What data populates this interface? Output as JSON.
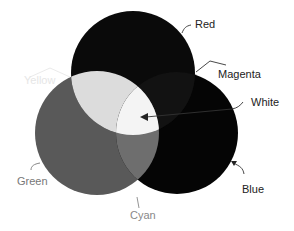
{
  "diagram": {
    "title": "",
    "type": "additive-color-venn",
    "circles": [
      {
        "id": "red",
        "label": "Red",
        "cx": 133,
        "cy": 73,
        "r": 62,
        "fill": "#0a0a0a"
      },
      {
        "id": "green",
        "label": "Green",
        "cx": 97,
        "cy": 133,
        "r": 62,
        "fill": "#595959"
      },
      {
        "id": "blue",
        "label": "Blue",
        "cx": 177,
        "cy": 133,
        "r": 61,
        "fill": "#050505"
      }
    ],
    "overlaps": {
      "yellow": {
        "label": "Yellow",
        "fill": "#dcdcdc"
      },
      "magenta": {
        "label": "Magenta",
        "fill": "#121212"
      },
      "cyan": {
        "label": "Cyan",
        "fill": "#6e6e6e"
      },
      "white": {
        "label": "White",
        "fill": "#f4f4f4"
      }
    },
    "labels": {
      "red": "Red",
      "magenta": "Magenta",
      "white": "White",
      "yellow": "Yellow",
      "green": "Green",
      "blue": "Blue",
      "cyan": "Cyan"
    },
    "colors": {
      "text_dark": "#222222",
      "text_light": "#777777",
      "yellow_text": "#e6e6e6",
      "leader": "#333333"
    }
  }
}
